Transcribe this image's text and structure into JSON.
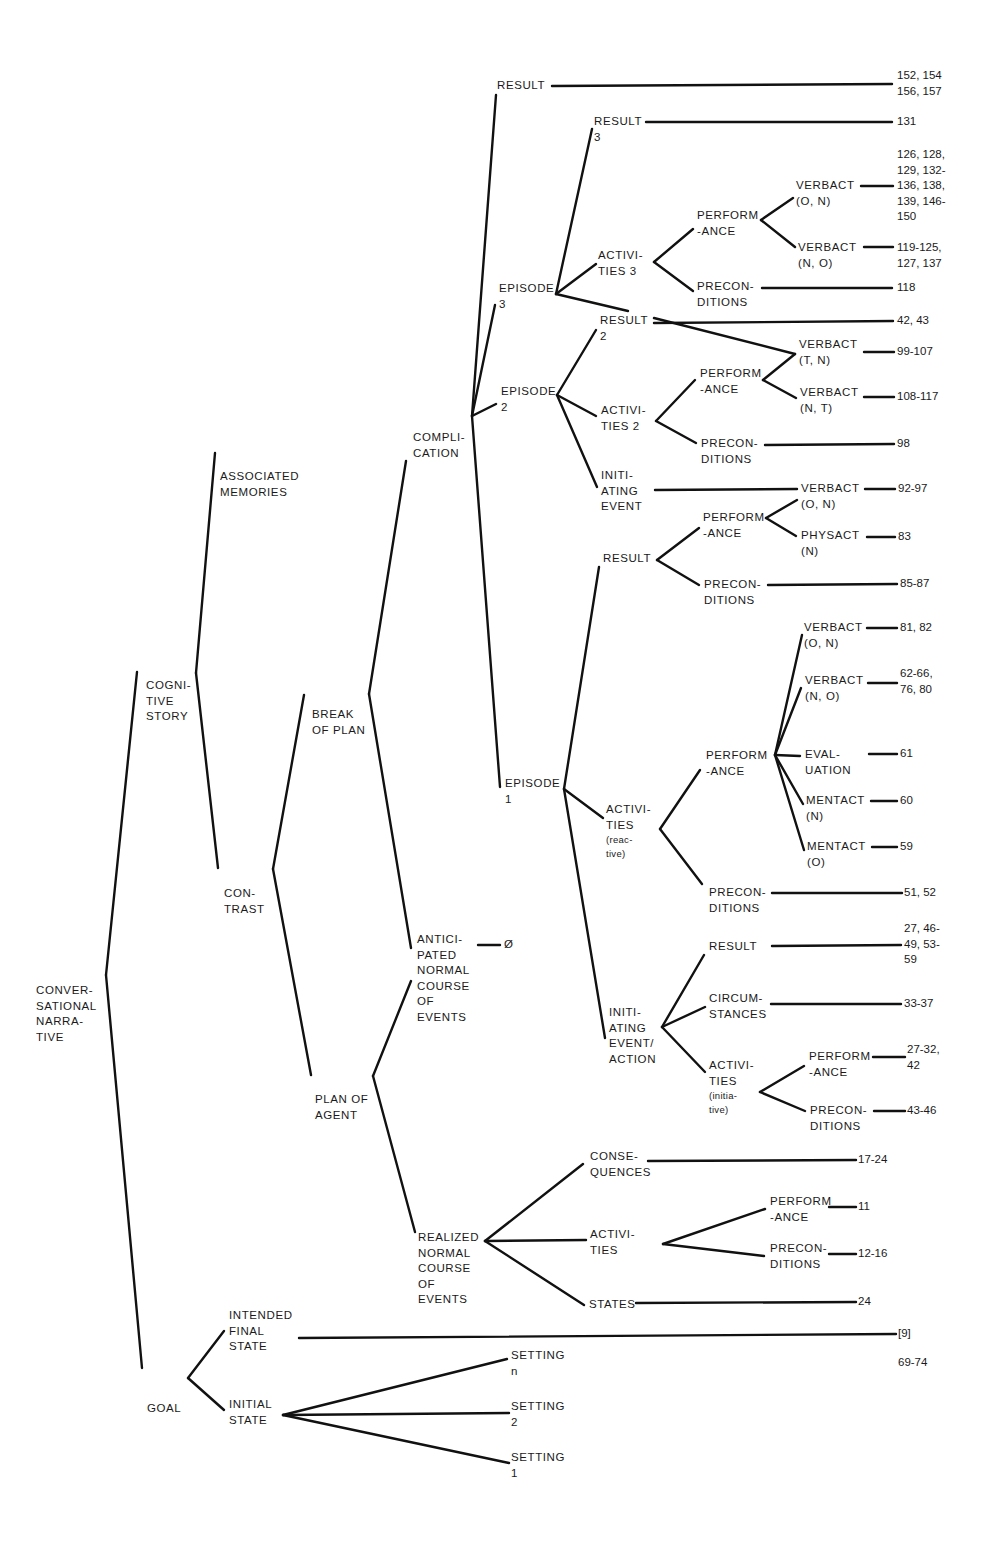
{
  "diagram": {
    "type": "tree",
    "root": "CONVERSATIONAL NARRATIVE",
    "line_color": "#111111",
    "background": "#ffffff"
  },
  "nodes": {
    "conversational_narrative": [
      "CONVER-",
      "SATIONAL",
      "NARRA-",
      "TIVE"
    ],
    "cognitive_story": [
      "COGNI-",
      "TIVE",
      "STORY"
    ],
    "goal": [
      "GOAL"
    ],
    "associated_memories": [
      "ASSOCIATED",
      "MEMORIES"
    ],
    "contrast": [
      "CON-",
      "TRAST"
    ],
    "break_of_plan": [
      "BREAK",
      "OF PLAN"
    ],
    "plan_of_agent": [
      "PLAN OF",
      "AGENT"
    ],
    "complication": [
      "COMPLI-",
      "CATION"
    ],
    "anticipated_normal": [
      "ANTICI-",
      "PATED",
      "NORMAL",
      "COURSE",
      "OF",
      "EVENTS"
    ],
    "realized_normal": [
      "REALIZED",
      "NORMAL",
      "COURSE",
      "OF",
      "EVENTS"
    ],
    "result_top": [
      "RESULT"
    ],
    "episode3": [
      "EPISODE",
      "3"
    ],
    "result3": [
      "RESULT",
      "3"
    ],
    "activities3": [
      "ACTIVI-",
      "TIES 3"
    ],
    "e3_performance": [
      "PERFORM",
      "-ANCE"
    ],
    "e3_preconditions": [
      "PRECON-",
      "DITIONS"
    ],
    "e3_verbact_on": [
      "VERBACT",
      "(O, N)"
    ],
    "e3_verbact_no": [
      "VERBACT",
      "(N, O)"
    ],
    "episode2": [
      "EPISODE",
      "2"
    ],
    "result2": [
      "RESULT",
      "2"
    ],
    "activities2": [
      "ACTIVI-",
      "TIES 2"
    ],
    "e2_performance": [
      "PERFORM",
      "-ANCE"
    ],
    "e2_preconditions": [
      "PRECON-",
      "DITIONS"
    ],
    "e2_verbact_tn": [
      "VERBACT",
      "(T, N)"
    ],
    "e2_verbact_nt": [
      "VERBACT",
      "(N, T)"
    ],
    "e2_initiating": [
      "INITI-",
      "ATING",
      "EVENT"
    ],
    "e2_init_verbact": [
      "VERBACT",
      "(O, N)"
    ],
    "episode1": [
      "EPISODE",
      "1"
    ],
    "e1_result": [
      "RESULT"
    ],
    "e1_res_performance": [
      "PERFORM",
      "-ANCE"
    ],
    "e1_res_physact": [
      "PHYSACT",
      "(N)"
    ],
    "e1_res_preconditions": [
      "PRECON-",
      "DITIONS"
    ],
    "e1_activities": [
      "ACTIVI-",
      "TIES"
    ],
    "e1_activities_note": [
      "(reac-",
      "tive)"
    ],
    "e1_act_performance": [
      "PERFORM",
      "-ANCE"
    ],
    "e1_verbact_on": [
      "VERBACT",
      "(O, N)"
    ],
    "e1_verbact_no": [
      "VERBACT",
      "(N, O)"
    ],
    "e1_evaluation": [
      "EVAL-",
      "UATION"
    ],
    "e1_mentact_n": [
      "MENTACT",
      "(N)"
    ],
    "e1_mentact_o": [
      "MENTACT",
      "(O)"
    ],
    "e1_act_preconditions": [
      "PRECON-",
      "DITIONS"
    ],
    "e1_initiating": [
      "INITI-",
      "ATING",
      "EVENT/",
      "ACTION"
    ],
    "e1_init_result": [
      "RESULT"
    ],
    "e1_init_circumstances": [
      "CIRCUM-",
      "STANCES"
    ],
    "e1_init_activities": [
      "ACTIVI-",
      "TIES"
    ],
    "e1_init_activities_note": [
      "(initia-",
      "tive)"
    ],
    "e1_init_performance": [
      "PERFORM",
      "-ANCE"
    ],
    "e1_init_preconditions": [
      "PRECON-",
      "DITIONS"
    ],
    "rn_consequences": [
      "CONSE-",
      "QUENCES"
    ],
    "rn_activities": [
      "ACTIVI-",
      "TIES"
    ],
    "rn_performance": [
      "PERFORM",
      "-ANCE"
    ],
    "rn_preconditions": [
      "PRECON-",
      "DITIONS"
    ],
    "rn_states": [
      "STATES"
    ],
    "intended_final_state": [
      "INTENDED",
      "FINAL",
      "STATE"
    ],
    "initial_state": [
      "INITIAL",
      "STATE"
    ],
    "setting_n": [
      "SETTING",
      "n"
    ],
    "setting_2": [
      "SETTING",
      "2"
    ],
    "setting_1": [
      "SETTING",
      "1"
    ]
  },
  "refs": {
    "result_top": [
      "152, 154",
      "156, 157"
    ],
    "result3": [
      "131"
    ],
    "e3_verbact_on": [
      "126, 128,",
      "129, 132-",
      "136, 138,",
      "139, 146-",
      "150"
    ],
    "e3_verbact_no": [
      "119-125,",
      "127, 137"
    ],
    "e3_preconditions": [
      "118"
    ],
    "result2": [
      "42, 43"
    ],
    "e2_verbact_tn": [
      "99-107"
    ],
    "e2_verbact_nt": [
      "108-117"
    ],
    "e2_preconditions": [
      "98"
    ],
    "e2_init_verbact": [
      "92-97"
    ],
    "e1_res_physact": [
      "83"
    ],
    "e1_res_preconditions": [
      "85-87"
    ],
    "e1_verbact_on": [
      "81, 82"
    ],
    "e1_verbact_no": [
      "62-66,",
      "76, 80"
    ],
    "e1_evaluation": [
      "61"
    ],
    "e1_mentact_n": [
      "60"
    ],
    "e1_mentact_o": [
      "59"
    ],
    "e1_act_preconditions": [
      "51, 52"
    ],
    "anticipated_normal": [
      "Ø"
    ],
    "e1_init_result": [
      "27, 46-",
      "49, 53-",
      "59"
    ],
    "e1_init_circumstances": [
      "33-37"
    ],
    "e1_init_performance": [
      "27-32,",
      "42"
    ],
    "e1_init_preconditions": [
      "43-46"
    ],
    "rn_consequences": [
      "17-24"
    ],
    "rn_performance": [
      "11"
    ],
    "rn_preconditions": [
      "12-16"
    ],
    "rn_states": [
      "24"
    ],
    "intended_final_state": [
      "[9]"
    ],
    "initial_state": [
      "69-74"
    ]
  }
}
